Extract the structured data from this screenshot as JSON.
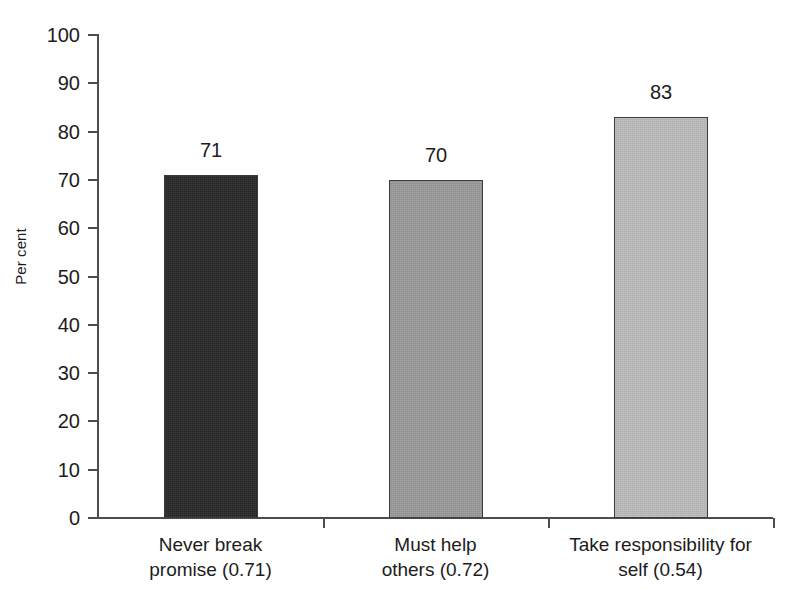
{
  "chart_data": {
    "type": "bar",
    "title": "",
    "xlabel": "",
    "ylabel": "Per cent",
    "ylim": [
      0,
      100
    ],
    "ystep": 10,
    "grid": false,
    "legend": "none",
    "categories": [
      "Never break promise (0.71)",
      "Must help others (0.72)",
      "Take responsibility for self (0.54)"
    ],
    "category_lines": [
      [
        "Never break",
        "promise (0.71)"
      ],
      [
        "Must help",
        "others (0.72)"
      ],
      [
        "Take responsibility for",
        "self (0.54)"
      ]
    ],
    "values": [
      71,
      70,
      83
    ],
    "value_labels": [
      "71",
      "70",
      "83"
    ],
    "bar_colors": [
      "#262626",
      "#9a9a9a",
      "#bdbdbd"
    ],
    "bar_border_color": "#3b3b3b",
    "axis_color": "#4d4d4d",
    "background": "#ffffff",
    "ytick_labels": [
      "100",
      "90",
      "80",
      "70",
      "60",
      "50",
      "40",
      "30",
      "20",
      "10",
      "0"
    ],
    "ytick_values": [
      100,
      90,
      80,
      70,
      60,
      50,
      40,
      30,
      20,
      10,
      0
    ]
  }
}
